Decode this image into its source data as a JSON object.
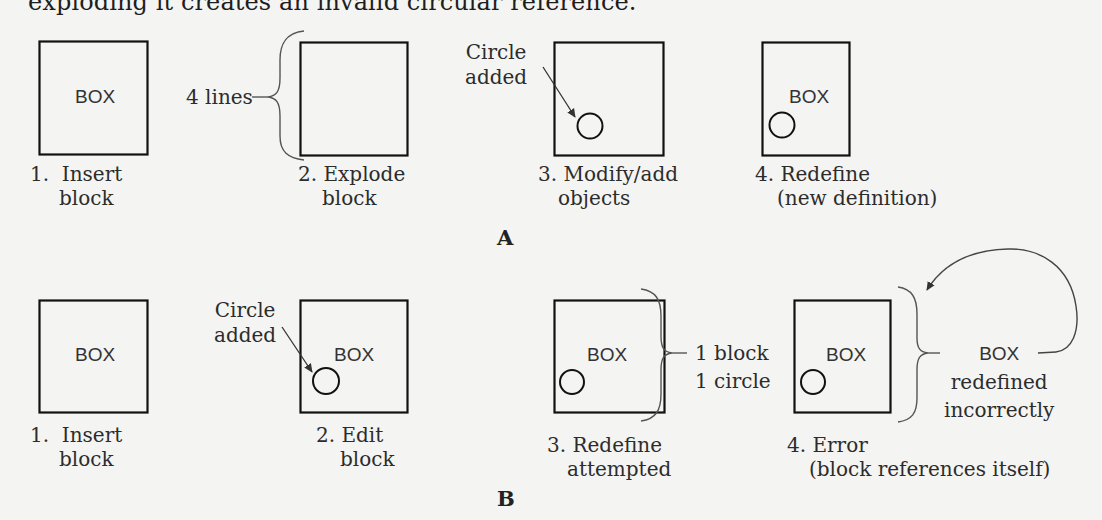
{
  "intro_text": "exploding it creates an invalid circular reference.",
  "panel_a": {
    "letter": "A",
    "steps": [
      {
        "number": "1.",
        "line1": "Insert",
        "line2": "block",
        "box_label": "BOX",
        "has_circle": false
      },
      {
        "number": "2.",
        "line1": "Explode",
        "line2": "block",
        "box_label": "",
        "has_circle": false,
        "brace_note": "4 lines"
      },
      {
        "number": "3.",
        "line1": "Modify/add",
        "line2": "objects",
        "box_label": "",
        "has_circle": true,
        "callout": {
          "line1": "Circle",
          "line2": "added"
        }
      },
      {
        "number": "4.",
        "line1": "Redefine",
        "line2": "(new definition)",
        "box_label": "BOX",
        "has_circle": true
      }
    ]
  },
  "panel_b": {
    "letter": "B",
    "steps": [
      {
        "number": "1.",
        "line1": "Insert",
        "line2": "block",
        "box_label": "BOX",
        "has_circle": false
      },
      {
        "number": "2.",
        "line1": "Edit",
        "line2": "block",
        "box_label": "BOX",
        "has_circle": true,
        "callout": {
          "line1": "Circle",
          "line2": "added"
        }
      },
      {
        "number": "3.",
        "line1": "Redefine",
        "line2": "attempted",
        "box_label": "BOX",
        "has_circle": true,
        "brace_note": {
          "line1": "1 block",
          "line2": "1 circle"
        }
      },
      {
        "number": "4.",
        "line1": "Error",
        "line2": "(block references itself)",
        "box_label": "BOX",
        "has_circle": true,
        "brace_note": {
          "line1": "BOX",
          "line2": "redefined",
          "line3": "incorrectly"
        }
      }
    ]
  },
  "colors": {
    "background": "#f4f4f2",
    "stroke": "#111111",
    "brace": "#555555",
    "text": "#2c2c2c"
  }
}
